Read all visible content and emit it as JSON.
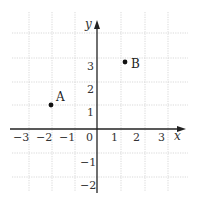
{
  "diagram": {
    "type": "coordinate-plane",
    "x_axis": {
      "label": "x",
      "ticks": [
        "-3",
        "-2",
        "-1",
        "0",
        "1",
        "2",
        "3"
      ]
    },
    "y_axis": {
      "label": "y",
      "ticks": [
        "3",
        "2",
        "1",
        "-1",
        "-2"
      ]
    },
    "points": [
      {
        "name": "A",
        "approx_x": -2,
        "approx_y": 1
      },
      {
        "name": "B",
        "approx_x": 1.2,
        "approx_y": 2.8
      }
    ],
    "grid": {
      "x_range": [
        -3,
        3
      ],
      "y_range": [
        -2,
        4
      ]
    }
  }
}
